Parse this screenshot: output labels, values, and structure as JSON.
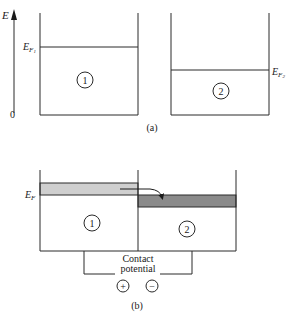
{
  "figure": {
    "type": "energy-band-diagram",
    "colors": {
      "line": "#2a2a2a",
      "band_metal1": "#cfcfcf",
      "band_metal2": "#8a8a8a",
      "background": "#ffffff"
    }
  },
  "panel_a": {
    "caption": "(a)",
    "axis": {
      "label": "E",
      "origin_label": "0"
    },
    "metal1": {
      "id": "1",
      "fermi_label_main": "E",
      "fermi_label_sub": "F",
      "fermi_label_subsub": "1"
    },
    "metal2": {
      "id": "2",
      "fermi_label_main": "E",
      "fermi_label_sub": "F",
      "fermi_label_subsub": "2"
    }
  },
  "panel_b": {
    "caption": "(b)",
    "fermi_label_main": "E",
    "fermi_label_sub": "F",
    "metal1": {
      "id": "1"
    },
    "metal2": {
      "id": "2"
    },
    "contact_potential": {
      "line1": "Contact",
      "line2": "potential",
      "plus": "+",
      "minus": "−"
    }
  }
}
